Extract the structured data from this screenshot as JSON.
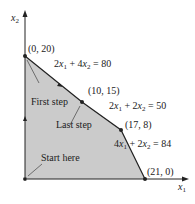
{
  "diagram": {
    "type": "linear-programming-feasible-region",
    "axes": {
      "x_label": "x",
      "x_sub": "1",
      "y_label": "x",
      "y_sub": "2"
    },
    "vertices": [
      {
        "label": "(0, 20)",
        "x": 0,
        "y": 20
      },
      {
        "label": "(10, 15)",
        "x": 10,
        "y": 15
      },
      {
        "label": "(17, 8)",
        "x": 17,
        "y": 8
      },
      {
        "label": "(21, 0)",
        "x": 21,
        "y": 0
      },
      {
        "label": "",
        "x": 0,
        "y": 0
      }
    ],
    "constraints": [
      {
        "text_a": "2",
        "var_a": "x",
        "sub_a": "1",
        "op": " + 4",
        "var_b": "x",
        "sub_b": "2",
        "rhs": " = 80"
      },
      {
        "text_a": "2",
        "var_a": "x",
        "sub_a": "1",
        "op": " + 2",
        "var_b": "x",
        "sub_b": "2",
        "rhs": " = 50"
      },
      {
        "text_a": "4",
        "var_a": "x",
        "sub_a": "1",
        "op": " + 2",
        "var_b": "x",
        "sub_b": "2",
        "rhs": " = 84"
      }
    ],
    "annotations": {
      "start": "Start here",
      "first": "First step",
      "last": "Last step"
    },
    "colors": {
      "region": "#c8c8c8",
      "line": "#222222"
    }
  }
}
